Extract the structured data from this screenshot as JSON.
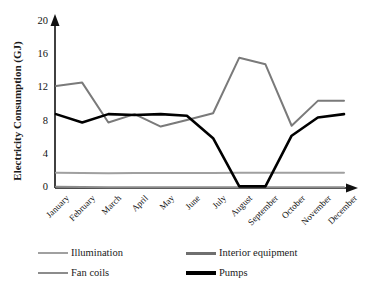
{
  "chart_data": {
    "type": "line",
    "title": "",
    "xlabel": "",
    "ylabel": "Electricity Consumption (GJ)",
    "categories": [
      "January",
      "February",
      "March",
      "April",
      "May",
      "June",
      "July",
      "August",
      "September",
      "October",
      "November",
      "December"
    ],
    "ylim": [
      0,
      20
    ],
    "yticks": [
      0,
      4,
      8,
      12,
      16,
      20
    ],
    "grid": false,
    "legend_position": "bottom",
    "series": [
      {
        "name": "Illumination",
        "color": "#a0a0a0",
        "width": 2.0,
        "values": [
          1.85,
          1.8,
          1.78,
          1.8,
          1.82,
          1.82,
          1.82,
          1.85,
          1.85,
          1.85,
          1.85,
          1.85
        ]
      },
      {
        "name": "Interior equipment",
        "color": "#7a7a7a",
        "width": 2.0,
        "values": [
          12.3,
          12.7,
          7.9,
          8.9,
          7.4,
          8.2,
          9.0,
          15.7,
          14.9,
          7.5,
          10.5,
          10.5
        ]
      },
      {
        "name": "Fan coils",
        "color": "#8c8c8c",
        "width": 2.0,
        "values": [
          0.15,
          0.12,
          0.1,
          0.1,
          0.1,
          0.1,
          0.1,
          0.1,
          0.1,
          0.1,
          0.1,
          0.1
        ]
      },
      {
        "name": "Pumps",
        "color": "#000000",
        "width": 2.6,
        "values": [
          8.9,
          7.9,
          8.9,
          8.8,
          8.9,
          8.7,
          6.0,
          0.2,
          0.2,
          6.3,
          8.5,
          8.9
        ]
      }
    ]
  },
  "axis": {
    "ytick_labels": [
      "0",
      "4",
      "8",
      "12",
      "16",
      "20"
    ]
  },
  "legend": {
    "items": [
      {
        "label": "Illumination",
        "color": "#a0a0a0",
        "width": 2.0
      },
      {
        "label": "Interior equipment",
        "color": "#7a7a7a",
        "width": 2.4
      },
      {
        "label": "Fan coils",
        "color": "#8c8c8c",
        "width": 2.2
      },
      {
        "label": "Pumps",
        "color": "#000000",
        "width": 3.0
      }
    ]
  }
}
